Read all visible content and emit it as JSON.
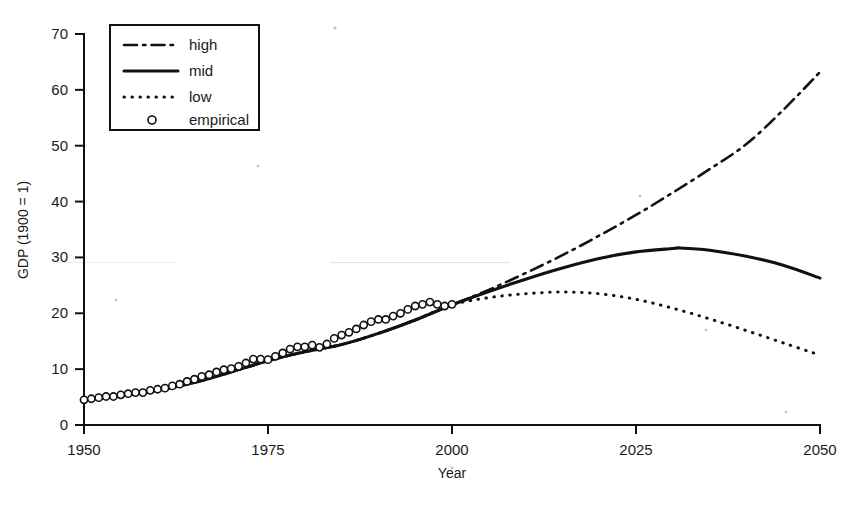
{
  "chart_data": {
    "type": "line",
    "title": "",
    "xlabel": "Year",
    "ylabel": "GDP (1900 = 1)",
    "xlim": [
      1950,
      2050
    ],
    "ylim": [
      0,
      70
    ],
    "xticks": [
      1950,
      1975,
      2000,
      2025,
      2050
    ],
    "yticks": [
      0,
      10,
      20,
      30,
      40,
      50,
      60,
      70
    ],
    "grid": false,
    "legend_position": "top-left",
    "series": [
      {
        "name": "high",
        "style": "dash-dot",
        "x": [
          1950,
          1955,
          1960,
          1965,
          1970,
          1975,
          1980,
          1985,
          1990,
          1995,
          2000,
          2005,
          2010,
          2015,
          2020,
          2025,
          2030,
          2035,
          2040,
          2045,
          2050
        ],
        "values": [
          4.5,
          5.3,
          6.2,
          7.6,
          9.5,
          11.5,
          13.1,
          14.4,
          16.4,
          18.8,
          21.5,
          24.2,
          27.2,
          30.4,
          33.9,
          37.6,
          41.6,
          45.8,
          50.3,
          56.4,
          63.2
        ]
      },
      {
        "name": "mid",
        "style": "solid",
        "x": [
          1950,
          1955,
          1960,
          1965,
          1970,
          1975,
          1980,
          1985,
          1990,
          1995,
          2000,
          2005,
          2010,
          2015,
          2020,
          2025,
          2030,
          2031,
          2035,
          2040,
          2045,
          2050
        ],
        "values": [
          4.5,
          5.3,
          6.2,
          7.6,
          9.5,
          11.5,
          13.1,
          14.4,
          16.4,
          18.8,
          21.5,
          23.9,
          26.1,
          28.1,
          29.8,
          31.0,
          31.6,
          31.7,
          31.3,
          30.2,
          28.6,
          26.3
        ]
      },
      {
        "name": "low",
        "style": "dotted",
        "x": [
          1950,
          1955,
          1960,
          1965,
          1970,
          1975,
          1980,
          1985,
          1990,
          1995,
          2000,
          2005,
          2010,
          2015,
          2020,
          2025,
          2030,
          2035,
          2040,
          2045,
          2050
        ],
        "values": [
          4.5,
          5.3,
          6.2,
          7.6,
          9.5,
          11.5,
          13.1,
          14.4,
          16.4,
          18.8,
          21.5,
          22.8,
          23.5,
          23.8,
          23.5,
          22.5,
          20.9,
          19.0,
          16.9,
          14.7,
          12.5
        ]
      },
      {
        "name": "empirical",
        "style": "circle-markers",
        "x": [
          1950,
          1951,
          1952,
          1953,
          1954,
          1955,
          1956,
          1957,
          1958,
          1959,
          1960,
          1961,
          1962,
          1963,
          1964,
          1965,
          1966,
          1967,
          1968,
          1969,
          1970,
          1971,
          1972,
          1973,
          1974,
          1975,
          1976,
          1977,
          1978,
          1979,
          1980,
          1981,
          1982,
          1983,
          1984,
          1985,
          1986,
          1987,
          1988,
          1989,
          1990,
          1991,
          1992,
          1993,
          1994,
          1995,
          1996,
          1997,
          1998,
          1999,
          2000
        ],
        "values": [
          4.5,
          4.7,
          4.9,
          5.1,
          5.1,
          5.4,
          5.6,
          5.8,
          5.8,
          6.2,
          6.4,
          6.6,
          7.0,
          7.3,
          7.8,
          8.2,
          8.7,
          9.0,
          9.5,
          9.9,
          10.1,
          10.5,
          11.1,
          11.8,
          11.8,
          11.7,
          12.3,
          12.9,
          13.6,
          14.0,
          14.0,
          14.3,
          13.9,
          14.5,
          15.5,
          16.1,
          16.6,
          17.2,
          17.9,
          18.5,
          18.9,
          18.9,
          19.5,
          20.0,
          20.7,
          21.3,
          21.6,
          22.0,
          21.6,
          21.3,
          21.6
        ]
      }
    ]
  },
  "legend": {
    "entries": [
      {
        "label": "high",
        "style": "dash-dot"
      },
      {
        "label": "mid",
        "style": "solid"
      },
      {
        "label": "low",
        "style": "dotted"
      },
      {
        "label": "empirical",
        "style": "circle-marker"
      }
    ]
  },
  "axes": {
    "x_title": "Year",
    "y_title": "GDP (1900 = 1)",
    "x_tick_labels": [
      "1950",
      "1975",
      "2000",
      "2025",
      "2050"
    ],
    "y_tick_labels": [
      "0",
      "10",
      "20",
      "30",
      "40",
      "50",
      "60",
      "70"
    ]
  },
  "colors": {
    "ink": "#111111",
    "background": "#ffffff"
  }
}
